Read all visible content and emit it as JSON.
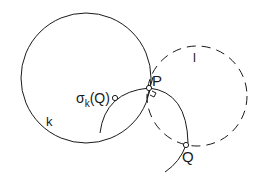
{
  "diagram": {
    "stroke_color": "#1a1a1a",
    "background": "#ffffff",
    "circles": {
      "k": {
        "label": "k",
        "style": "solid",
        "cx": 86,
        "cy": 78,
        "r": 65
      },
      "l": {
        "label": "l",
        "style": "dashed",
        "cx": 197,
        "cy": 96,
        "r": 50
      }
    },
    "points": {
      "P": {
        "label": "P",
        "x": 149,
        "y": 88
      },
      "Q": {
        "label": "Q",
        "x": 186,
        "y": 145
      },
      "sigma_Q": {
        "label_main": "σ",
        "label_sub": "k",
        "label_arg": "(Q)",
        "x": 115,
        "y": 98
      }
    },
    "annotations": {
      "right_angle_at": "P"
    }
  }
}
